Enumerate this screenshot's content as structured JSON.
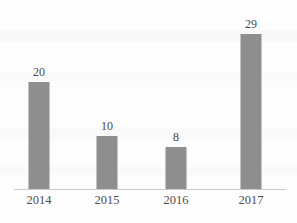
{
  "chart_data": {
    "type": "bar",
    "title": "",
    "subtitle": "",
    "xlabel": "",
    "ylabel": "",
    "categories": [
      "2014",
      "2015",
      "2016",
      "2017"
    ],
    "values": [
      20,
      10,
      8,
      29
    ],
    "data_labels": [
      "20",
      "10",
      "8",
      "29"
    ],
    "series": [
      {
        "name": "",
        "values": [
          20,
          10,
          8,
          29
        ]
      }
    ],
    "ylim": [
      0,
      32
    ],
    "grid": false,
    "legend": false,
    "legend_position": "none",
    "axis_visible": {
      "x_axis_line": true,
      "y_axis_line": false,
      "x_ticks": false,
      "y_ticks": false,
      "y_tick_labels": false
    },
    "colors": {
      "bar": "#8e8e8e",
      "axis_line": "#c9c9c9",
      "value_label_text": "#4a4a4a",
      "category_label_text": "#4d4d4d",
      "background": "#fdfdfd"
    }
  }
}
